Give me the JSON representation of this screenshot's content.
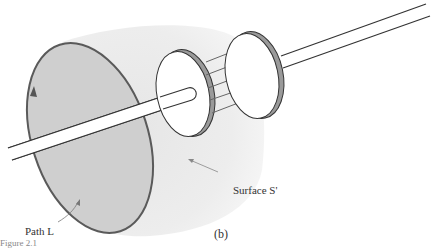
{
  "figure": {
    "subfigure_label": "(b)",
    "caption_partial": "Figure 2.1",
    "labels": {
      "path": "Path L",
      "surface": "Surface S'"
    },
    "elements": [
      {
        "name": "path-l-ellipse",
        "description": "Closed loop path L drawn as a shaded ellipse with a direction arrow"
      },
      {
        "name": "surface-s-prime",
        "description": "Bulging balloon-shaped surface S' passing between capacitor plates"
      },
      {
        "name": "wire-left",
        "description": "Current-carrying wire entering the left capacitor plate"
      },
      {
        "name": "capacitor-plate-left",
        "description": "Left circular capacitor plate"
      },
      {
        "name": "capacitor-plate-right",
        "description": "Right circular capacitor plate"
      },
      {
        "name": "field-arrows",
        "description": "Five electric field arrows between plates"
      },
      {
        "name": "wire-right",
        "description": "Wire leaving the right capacitor plate"
      }
    ],
    "field_arrow_count": 5,
    "colors": {
      "path_fill": "#cfcfcf",
      "path_stroke": "#555555",
      "surface_fill": "#ececec",
      "plate_edge": "#8a8a8a",
      "line": "#333333"
    }
  }
}
